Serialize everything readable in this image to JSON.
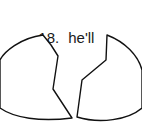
{
  "item": {
    "number": "18.",
    "word": "he'll"
  },
  "puzzle": {
    "left_piece": "left-half-shape",
    "right_piece": "right-half-shape",
    "stroke_color": "#111111"
  }
}
